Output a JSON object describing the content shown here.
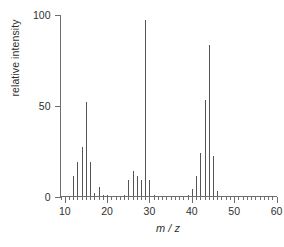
{
  "chart_data": {
    "type": "bar",
    "title": "",
    "subtitle": "",
    "xlabel": "m / z",
    "ylabel": "relative intensity",
    "xlim": [
      9,
      60
    ],
    "ylim": [
      0,
      100
    ],
    "xticks": [
      10,
      20,
      30,
      40,
      50,
      60
    ],
    "xtick_labels": [
      "10",
      "20",
      "30",
      "40",
      "50",
      "60"
    ],
    "xminor_tick_step": 1,
    "yticks": [
      0,
      50,
      100
    ],
    "ytick_labels": [
      "0",
      "50",
      "100"
    ],
    "grid": false,
    "legend": false,
    "bar_color": "#555555",
    "axis_color": "#6e6e6e",
    "text_color": "#2f2f2f",
    "background": "#ffffff",
    "series_name": "relative intensity",
    "categories": [
      12,
      13,
      14,
      15,
      16,
      17,
      18,
      19,
      20,
      24,
      25,
      26,
      27,
      28,
      29,
      30,
      31,
      39,
      40,
      41,
      42,
      43,
      44,
      45,
      46
    ],
    "values": [
      11,
      19,
      27,
      52,
      19,
      2,
      5,
      1,
      1,
      1,
      9,
      14,
      11,
      9,
      97,
      9,
      1,
      1,
      4,
      11,
      24,
      53,
      83,
      22,
      3
    ]
  },
  "axes": {
    "y_label": "relative intensity",
    "x_label": "m / z"
  }
}
